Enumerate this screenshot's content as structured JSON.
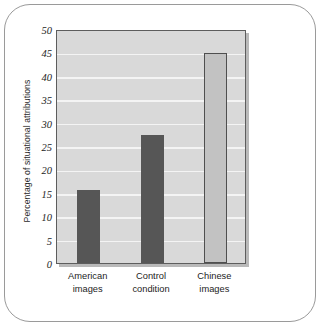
{
  "chart_data": {
    "type": "bar",
    "title": "",
    "subtitle": "",
    "xlabel": "",
    "ylabel": "Percentage of situational attributions",
    "categories": [
      "American images",
      "Control condition",
      "Chinese images"
    ],
    "category_lines": [
      [
        "American",
        "images"
      ],
      [
        "Control",
        "condition"
      ],
      [
        "Chinese",
        "images"
      ]
    ],
    "values": [
      15.7,
      27.3,
      44.9
    ],
    "ylim": [
      0,
      50
    ],
    "ytick_step": 5,
    "ytick_labels": [
      "0",
      "5",
      "10",
      "15",
      "20",
      "25",
      "30",
      "35",
      "40",
      "45",
      "50"
    ],
    "ytick_values": [
      0,
      5,
      10,
      15,
      20,
      25,
      30,
      35,
      40,
      45,
      50
    ],
    "grid": true,
    "grid_color": "#f4f4f4",
    "legend": "none",
    "plot_background": "#d9d9d9",
    "bar_styles": [
      "dark",
      "dark",
      "light"
    ],
    "bar_color_dark": "#565656",
    "bar_color_light": "#c2c2c2",
    "bar_outline_light": "#4f4f4f",
    "axis_color": "#5d5d5d",
    "frame_color": "#9a9a9a"
  }
}
